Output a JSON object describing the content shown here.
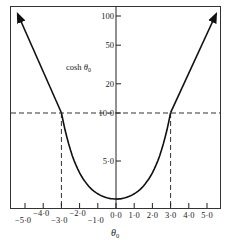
{
  "chart_data": {
    "type": "line",
    "title": "",
    "xlabel": "θ0",
    "ylabel": "cosh θ0",
    "curve_label": "cosh θ0",
    "x_ticks": [
      -5.0,
      -4.0,
      -3.0,
      -2.0,
      -1.0,
      0.0,
      1.0,
      2.0,
      3.0,
      4.0,
      5.0
    ],
    "x_tick_labels": [
      "−5·0",
      "−4·0",
      "−3·0",
      "−2·0",
      "−1·0",
      "0·0",
      "1·0",
      "2·0",
      "3·0",
      "4·0",
      "5·0"
    ],
    "y_ticks": [
      1,
      5,
      10,
      20,
      50,
      100
    ],
    "y_tick_labels": [
      "",
      "5·0",
      "10·0",
      "20",
      "50",
      "100"
    ],
    "y_scale": "linear below 10, logarithmic above 10",
    "xlim": [
      -5.5,
      5.7
    ],
    "ylim": [
      0,
      100
    ],
    "series": [
      {
        "name": "cosh θ0",
        "x": [
          -5.4,
          -4.0,
          -3.0,
          -2.5,
          -2.0,
          -1.5,
          -1.0,
          -0.5,
          0.0,
          0.5,
          1.0,
          1.5,
          2.0,
          2.5,
          3.0,
          4.0,
          5.5
        ],
        "y": [
          110,
          27.3,
          10.07,
          6.13,
          3.76,
          2.35,
          1.54,
          1.13,
          1.0,
          1.13,
          1.54,
          2.35,
          3.76,
          6.13,
          10.07,
          27.3,
          110
        ],
        "arrowheads": "both ends"
      }
    ],
    "reference_lines": [
      {
        "orientation": "horizontal",
        "value": 10.0,
        "style": "dashed"
      },
      {
        "orientation": "vertical",
        "value": -3.0,
        "style": "dashed"
      },
      {
        "orientation": "vertical",
        "value": 3.0,
        "style": "dashed"
      }
    ],
    "grid": false,
    "legend": "none"
  }
}
